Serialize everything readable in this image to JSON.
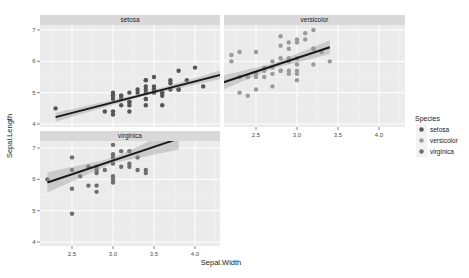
{
  "chart_data": {
    "type": "scatter",
    "title": "",
    "xlabel": "Sepal.Width",
    "ylabel": "Sepal.Length",
    "facet_by": "Species",
    "xlim": [
      2.1,
      4.5
    ],
    "ylim": [
      3.9,
      7.4
    ],
    "x_ticks": [
      2.5,
      3.0,
      3.5,
      4.0
    ],
    "x_tick_labels": [
      "2.5",
      "3.0",
      "3.5",
      "4.0"
    ],
    "y_ticks": [
      4,
      5,
      6,
      7
    ],
    "y_tick_labels": [
      "4",
      "5",
      "6",
      "7"
    ],
    "grid": true,
    "legend": {
      "title": "Species",
      "position": "right",
      "entries": [
        {
          "label": "setosa",
          "color": "#555555"
        },
        {
          "label": "versicolor",
          "color": "#9a9a9a"
        },
        {
          "label": "virginica",
          "color": "#6e6e6e"
        }
      ]
    },
    "panels": [
      {
        "name": "setosa",
        "show_x_axis": false,
        "show_y_axis": true,
        "points": [
          [
            2.3,
            4.5
          ],
          [
            2.9,
            4.4
          ],
          [
            3.0,
            4.4
          ],
          [
            3.0,
            4.3
          ],
          [
            3.0,
            4.8
          ],
          [
            3.0,
            4.9
          ],
          [
            3.0,
            5.0
          ],
          [
            3.1,
            4.6
          ],
          [
            3.1,
            4.9
          ],
          [
            3.2,
            4.4
          ],
          [
            3.2,
            4.6
          ],
          [
            3.2,
            4.7
          ],
          [
            3.2,
            5.0
          ],
          [
            3.3,
            5.1
          ],
          [
            3.3,
            5.0
          ],
          [
            3.4,
            4.6
          ],
          [
            3.4,
            4.8
          ],
          [
            3.4,
            5.0
          ],
          [
            3.4,
            5.1
          ],
          [
            3.4,
            5.2
          ],
          [
            3.4,
            5.4
          ],
          [
            3.5,
            5.0
          ],
          [
            3.5,
            5.1
          ],
          [
            3.5,
            5.2
          ],
          [
            3.5,
            5.5
          ],
          [
            3.6,
            4.6
          ],
          [
            3.6,
            4.9
          ],
          [
            3.6,
            5.0
          ],
          [
            3.7,
            5.1
          ],
          [
            3.7,
            5.3
          ],
          [
            3.7,
            5.4
          ],
          [
            3.8,
            5.1
          ],
          [
            3.8,
            5.7
          ],
          [
            3.9,
            5.4
          ],
          [
            4.0,
            5.8
          ],
          [
            4.1,
            5.2
          ],
          [
            3.1,
            4.8
          ],
          [
            3.2,
            4.7
          ],
          [
            3.4,
            4.8
          ],
          [
            3.0,
            4.9
          ],
          [
            3.5,
            5.1
          ],
          [
            3.8,
            5.1
          ],
          [
            3.6,
            5.0
          ],
          [
            3.4,
            5.4
          ],
          [
            3.1,
            4.9
          ]
        ],
        "fit": {
          "x": [
            2.3,
            4.4
          ],
          "y": [
            4.22,
            5.63
          ]
        },
        "ci_halfwidth": [
          0.14,
          0.05,
          0.14
        ]
      },
      {
        "name": "versicolor",
        "show_x_axis": true,
        "show_y_axis": false,
        "points": [
          [
            2.0,
            5.0
          ],
          [
            2.2,
            6.0
          ],
          [
            2.2,
            6.2
          ],
          [
            2.3,
            5.5
          ],
          [
            2.3,
            6.3
          ],
          [
            2.3,
            5.0
          ],
          [
            2.4,
            5.5
          ],
          [
            2.4,
            4.9
          ],
          [
            2.5,
            5.5
          ],
          [
            2.5,
            6.3
          ],
          [
            2.5,
            5.6
          ],
          [
            2.5,
            5.1
          ],
          [
            2.6,
            5.5
          ],
          [
            2.6,
            5.7
          ],
          [
            2.6,
            5.8
          ],
          [
            2.7,
            5.8
          ],
          [
            2.7,
            5.6
          ],
          [
            2.7,
            5.2
          ],
          [
            2.7,
            6.0
          ],
          [
            2.8,
            5.7
          ],
          [
            2.8,
            6.8
          ],
          [
            2.8,
            6.5
          ],
          [
            2.8,
            6.1
          ],
          [
            2.8,
            5.7
          ],
          [
            2.9,
            6.6
          ],
          [
            2.9,
            6.4
          ],
          [
            2.9,
            6.1
          ],
          [
            2.9,
            5.6
          ],
          [
            2.9,
            6.0
          ],
          [
            2.9,
            5.7
          ],
          [
            3.0,
            6.7
          ],
          [
            3.0,
            6.6
          ],
          [
            3.0,
            5.9
          ],
          [
            3.0,
            5.6
          ],
          [
            3.0,
            5.4
          ],
          [
            3.0,
            5.7
          ],
          [
            3.0,
            6.1
          ],
          [
            3.1,
            6.9
          ],
          [
            3.1,
            6.7
          ],
          [
            3.2,
            7.0
          ],
          [
            3.2,
            6.4
          ],
          [
            3.2,
            5.9
          ],
          [
            3.3,
            6.3
          ],
          [
            3.4,
            6.0
          ],
          [
            3.2,
            6.4
          ]
        ],
        "fit": {
          "x": [
            2.0,
            3.4
          ],
          "y": [
            5.24,
            6.45
          ]
        },
        "ci_halfwidth": [
          0.25,
          0.08,
          0.22
        ]
      },
      {
        "name": "virginica",
        "show_x_axis": true,
        "show_y_axis": true,
        "points": [
          [
            2.2,
            6.0
          ],
          [
            2.5,
            6.7
          ],
          [
            2.5,
            6.3
          ],
          [
            2.5,
            5.7
          ],
          [
            2.5,
            4.9
          ],
          [
            2.6,
            6.1
          ],
          [
            2.7,
            6.4
          ],
          [
            2.7,
            5.8
          ],
          [
            2.8,
            6.4
          ],
          [
            2.8,
            6.3
          ],
          [
            2.8,
            6.2
          ],
          [
            2.8,
            5.8
          ],
          [
            2.8,
            5.6
          ],
          [
            2.9,
            6.3
          ],
          [
            3.0,
            7.1
          ],
          [
            3.0,
            6.8
          ],
          [
            3.0,
            6.7
          ],
          [
            3.0,
            6.5
          ],
          [
            3.0,
            6.1
          ],
          [
            3.0,
            6.0
          ],
          [
            3.0,
            5.9
          ],
          [
            3.1,
            6.9
          ],
          [
            3.1,
            6.4
          ],
          [
            3.2,
            6.9
          ],
          [
            3.2,
            6.5
          ],
          [
            3.2,
            6.4
          ],
          [
            3.3,
            6.7
          ],
          [
            3.3,
            6.3
          ],
          [
            3.4,
            6.3
          ],
          [
            3.4,
            6.2
          ]
        ],
        "fit": {
          "x": [
            2.2,
            3.8
          ],
          "y": [
            5.9,
            7.3
          ]
        },
        "ci_halfwidth": [
          0.32,
          0.08,
          0.35
        ]
      }
    ]
  }
}
